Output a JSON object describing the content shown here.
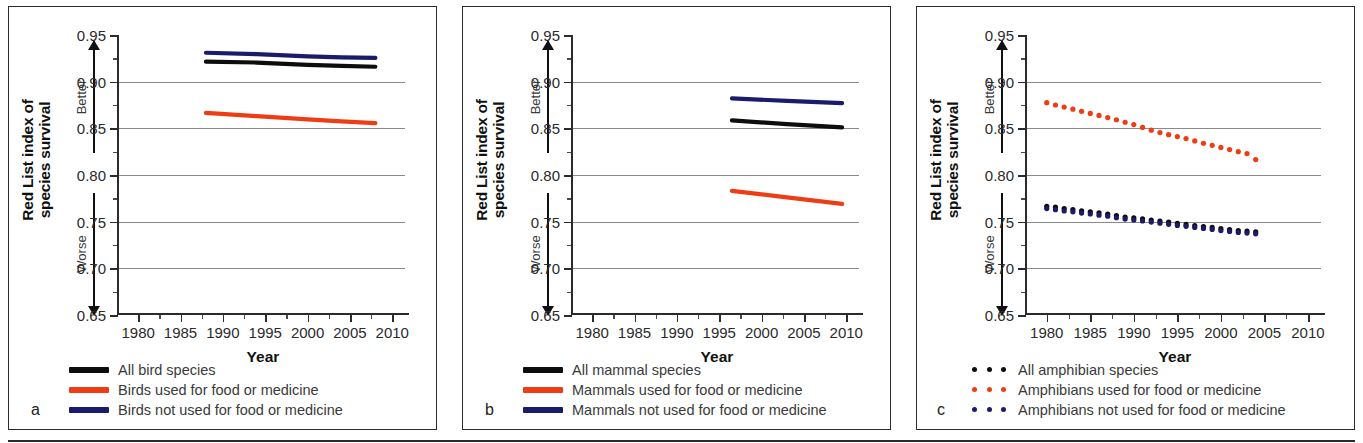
{
  "figure": {
    "background": "#ffffff",
    "bottom_rule": true
  },
  "axes": {
    "y_title_line1": "Red List index of",
    "y_title_line2": "species survival",
    "y_ticks": [
      "0.65",
      "0.70",
      "0.75",
      "0.80",
      "0.85",
      "0.90",
      "0.95"
    ],
    "y_min": 0.65,
    "y_max": 0.95,
    "gridline_values": [
      0.7,
      0.75,
      0.8,
      0.85,
      0.9
    ],
    "x_title": "Year",
    "x_ticks": [
      "1980",
      "1985",
      "1990",
      "1995",
      "2000",
      "2005",
      "2010"
    ],
    "x_min": 1977.5,
    "x_max": 2011.5,
    "better_label": "Better",
    "worse_label": "Worse"
  },
  "colors": {
    "all_species": "#0d0d0d",
    "used": "#ee3d14",
    "not_used": "#1b1b6b",
    "grid": "#8a8a8a",
    "axis": "#2b2b2b",
    "text": "#3a3a3a"
  },
  "panels": [
    {
      "letter": "a",
      "legend": [
        {
          "label": "All bird species",
          "color": "#0d0d0d",
          "marker": "line"
        },
        {
          "label": "Birds used for food or medicine",
          "color": "#ee3d14",
          "marker": "line"
        },
        {
          "label": "Birds not used for food or medicine",
          "color": "#1b1b6b",
          "marker": "line"
        }
      ]
    },
    {
      "letter": "b",
      "legend": [
        {
          "label": "All mammal species",
          "color": "#0d0d0d",
          "marker": "line"
        },
        {
          "label": "Mammals used for food or medicine",
          "color": "#ee3d14",
          "marker": "line"
        },
        {
          "label": "Mammals not used for food or medicine",
          "color": "#1b1b6b",
          "marker": "line"
        }
      ]
    },
    {
      "letter": "c",
      "legend": [
        {
          "label": "All amphibian species",
          "color": "#0d0d0d",
          "marker": "dots"
        },
        {
          "label": "Amphibians used for food or medicine",
          "color": "#ee3d14",
          "marker": "dots"
        },
        {
          "label": "Amphibians not used for food or medicine",
          "color": "#1b1b6b",
          "marker": "dots"
        }
      ]
    }
  ],
  "chart_data": [
    {
      "type": "line",
      "panel": "a",
      "title": "",
      "xlabel": "Year",
      "ylabel": "Red List index of species survival",
      "xlim": [
        1977.5,
        2011.5
      ],
      "ylim": [
        0.65,
        0.95
      ],
      "grid": true,
      "legend_position": "below-left",
      "x": [
        1988,
        1994,
        2000,
        2004,
        2008
      ],
      "series": [
        {
          "name": "All bird species",
          "color": "#0d0d0d",
          "marker": "line",
          "values": [
            0.9215,
            0.9205,
            0.918,
            0.917,
            0.916
          ]
        },
        {
          "name": "Birds used for food or medicine",
          "color": "#ee3d14",
          "marker": "line",
          "values": [
            0.8665,
            0.863,
            0.8595,
            0.8575,
            0.8555
          ]
        },
        {
          "name": "Birds not used for food or medicine",
          "color": "#1b1b6b",
          "marker": "line",
          "values": [
            0.931,
            0.9295,
            0.9272,
            0.926,
            0.9255
          ]
        }
      ]
    },
    {
      "type": "line",
      "panel": "b",
      "title": "",
      "xlabel": "Year",
      "ylabel": "Red List index of species survival",
      "xlim": [
        1977.5,
        2011.5
      ],
      "ylim": [
        0.65,
        0.95
      ],
      "grid": true,
      "legend_position": "below-left",
      "x": [
        1996.5,
        2003,
        2009.5
      ],
      "series": [
        {
          "name": "All mammal species",
          "color": "#0d0d0d",
          "marker": "line",
          "values": [
            0.8585,
            0.8545,
            0.851
          ]
        },
        {
          "name": "Mammals used for food or medicine",
          "color": "#ee3d14",
          "marker": "line",
          "values": [
            0.783,
            0.776,
            0.769
          ]
        },
        {
          "name": "Mammals not used for food or medicine",
          "color": "#1b1b6b",
          "marker": "line",
          "values": [
            0.882,
            0.8795,
            0.877
          ]
        }
      ]
    },
    {
      "type": "scatter",
      "panel": "c",
      "title": "",
      "xlabel": "Year",
      "ylabel": "Red List index of species survival",
      "xlim": [
        1977.5,
        2011.5
      ],
      "ylim": [
        0.65,
        0.95
      ],
      "grid": true,
      "legend_position": "below-left",
      "x": [
        1980,
        1981,
        1982,
        1983,
        1984,
        1985,
        1986,
        1987,
        1988,
        1989,
        1990,
        1991,
        1992,
        1993,
        1994,
        1995,
        1996,
        1997,
        1998,
        1999,
        2000,
        2001,
        2002,
        2003,
        2004
      ],
      "series": [
        {
          "name": "All amphibian species",
          "color": "#0d0d0d",
          "marker": "dots",
          "values": [
            0.7665,
            0.7655,
            0.764,
            0.763,
            0.7615,
            0.7605,
            0.7595,
            0.758,
            0.7565,
            0.755,
            0.754,
            0.753,
            0.7518,
            0.7505,
            0.7495,
            0.7482,
            0.747,
            0.7458,
            0.7448,
            0.7438,
            0.7425,
            0.7415,
            0.7405,
            0.7398,
            0.739
          ]
        },
        {
          "name": "Amphibians used for food or medicine",
          "color": "#ee3d14",
          "marker": "dots",
          "values": [
            0.8775,
            0.875,
            0.8728,
            0.8705,
            0.8682,
            0.866,
            0.8638,
            0.8615,
            0.8592,
            0.8565,
            0.854,
            0.851,
            0.848,
            0.8455,
            0.8432,
            0.8412,
            0.839,
            0.8365,
            0.834,
            0.8318,
            0.8295,
            0.8272,
            0.825,
            0.823,
            0.8165
          ]
        },
        {
          "name": "Amphibians not used for food or medicine",
          "color": "#1b1b6b",
          "marker": "dots",
          "values": [
            0.764,
            0.7628,
            0.7615,
            0.7605,
            0.7592,
            0.7582,
            0.757,
            0.7558,
            0.7542,
            0.7528,
            0.7518,
            0.7508,
            0.7496,
            0.7484,
            0.7472,
            0.746,
            0.745,
            0.7438,
            0.7428,
            0.7416,
            0.7405,
            0.7395,
            0.7385,
            0.7378,
            0.737
          ]
        }
      ]
    }
  ]
}
